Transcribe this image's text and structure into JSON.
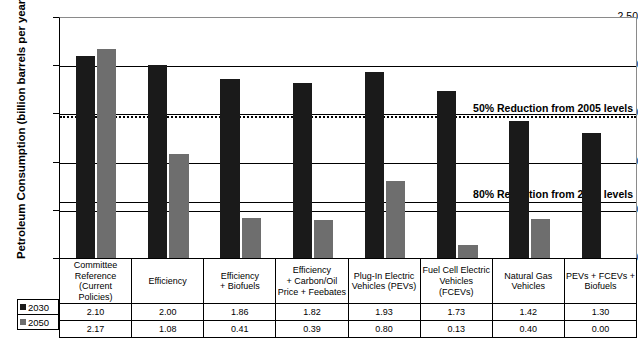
{
  "chart_data": {
    "type": "bar",
    "title": "",
    "xlabel": "",
    "ylabel": "Petroleum Consumption (billion barrels per year)",
    "ylim": [
      0.0,
      2.5
    ],
    "yticks": [
      "0.00",
      "0.50",
      "1.00",
      "1.50",
      "2.00",
      "2.50"
    ],
    "ytick_values": [
      0.0,
      0.5,
      1.0,
      1.5,
      2.0,
      2.5
    ],
    "grid": true,
    "legend_position": "bottom-left",
    "categories": [
      "Committee Reference (Current Policies)",
      "Efficiency",
      "Efficiency + Biofuels",
      "Efficiency + Carbon/Oil Price + Feebates",
      "Plug-In Electric Vehicles (PEVs)",
      "Fuel Cell Electric Vehicles (FCEVs)",
      "Natural Gas Vehicles",
      "PEVs + FCEVs + Biofuels"
    ],
    "category_lines": [
      [
        "Committee",
        "Reference",
        "(Current Policies)"
      ],
      [
        "Efficiency"
      ],
      [
        "Efficiency",
        "+ Biofuels"
      ],
      [
        "Efficiency",
        "+ Carbon/Oil",
        "Price + Feebates"
      ],
      [
        "Plug-In Electric",
        "Vehicles (PEVs)"
      ],
      [
        "Fuel Cell Electric",
        "Vehicles (FCEVs)"
      ],
      [
        "Natural Gas",
        "Vehicles"
      ],
      [
        "PEVs + FCEVs +",
        "Biofuels"
      ]
    ],
    "series": [
      {
        "name": "2030",
        "color": "#1a1a1a",
        "values": [
          2.1,
          2.0,
          1.86,
          1.82,
          1.93,
          1.73,
          1.42,
          1.3
        ],
        "labels": [
          "2.10",
          "2.00",
          "1.86",
          "1.82",
          "1.93",
          "1.73",
          "1.42",
          "1.30"
        ]
      },
      {
        "name": "2050",
        "color": "#6e6e6e",
        "values": [
          2.17,
          1.08,
          0.41,
          0.39,
          0.8,
          0.13,
          0.4,
          0.0
        ],
        "labels": [
          "2.17",
          "1.08",
          "0.41",
          "0.39",
          "0.80",
          "0.13",
          "0.40",
          "0.00"
        ]
      }
    ],
    "annotations": [
      {
        "text": "50% Reduction from  2005 levels",
        "value": 1.48,
        "style": "dotted"
      },
      {
        "text": "80% Reduction from  2005 levels",
        "value": 0.59,
        "style": "solid"
      }
    ]
  }
}
